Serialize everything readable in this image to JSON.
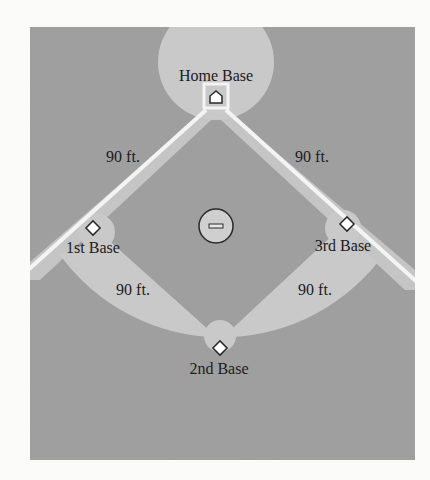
{
  "diagram": {
    "type": "baseball-diamond",
    "colors": {
      "page": "#fbfbfa",
      "panel": "#9e9e9e",
      "infield_light": "#c9c9c9",
      "foul_line": "#f4f4f4",
      "base_fill": "#ffffff",
      "outline": "#2a2a2a",
      "text": "#1c1c1c"
    },
    "bases": {
      "home": {
        "label": "Home Base",
        "x": 215,
        "y": 98
      },
      "first": {
        "label": "1st Base",
        "x": 93,
        "y": 228
      },
      "second": {
        "label": "2nd Base",
        "x": 220,
        "y": 348
      },
      "third": {
        "label": "3rd Base",
        "x": 348,
        "y": 224
      }
    },
    "pitchers_mound": {
      "label": "",
      "x": 216,
      "y": 228
    },
    "distances": {
      "home_to_first": "90 ft.",
      "home_to_third": "90 ft.",
      "first_to_second": "90 ft.",
      "third_to_second": "90 ft."
    }
  }
}
